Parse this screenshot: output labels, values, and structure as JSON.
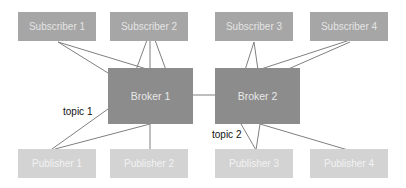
{
  "diagram": {
    "subscribers": [
      {
        "id": "sub1",
        "label": "Subscriber 1"
      },
      {
        "id": "sub2",
        "label": "Subscriber 2"
      },
      {
        "id": "sub3",
        "label": "Subscriber 3"
      },
      {
        "id": "sub4",
        "label": "Subscriber 4"
      }
    ],
    "brokers": [
      {
        "id": "broker1",
        "label": "Broker 1"
      },
      {
        "id": "broker2",
        "label": "Broker 2"
      }
    ],
    "publishers": [
      {
        "id": "pub1",
        "label": "Publisher 1"
      },
      {
        "id": "pub2",
        "label": "Publisher 2"
      },
      {
        "id": "pub3",
        "label": "Publisher 3"
      },
      {
        "id": "pub4",
        "label": "Publisher 4"
      }
    ],
    "topics": [
      {
        "id": "topic1",
        "label": "topic 1"
      },
      {
        "id": "topic2",
        "label": "topic 2"
      }
    ],
    "edges": [
      {
        "from": "sub1",
        "to": "broker1"
      },
      {
        "from": "sub1",
        "to": "broker1"
      },
      {
        "from": "sub2",
        "to": "broker1"
      },
      {
        "from": "sub2",
        "to": "broker1"
      },
      {
        "from": "sub2",
        "to": "broker1"
      },
      {
        "from": "sub3",
        "to": "broker2"
      },
      {
        "from": "sub3",
        "to": "broker2"
      },
      {
        "from": "sub4",
        "to": "broker2"
      },
      {
        "from": "sub4",
        "to": "broker2"
      },
      {
        "from": "broker1",
        "to": "broker2"
      },
      {
        "from": "pub1",
        "to": "broker1"
      },
      {
        "from": "pub1",
        "to": "broker1"
      },
      {
        "from": "pub2",
        "to": "broker1"
      },
      {
        "from": "pub3",
        "to": "broker2"
      },
      {
        "from": "pub3",
        "to": "broker2"
      },
      {
        "from": "pub4",
        "to": "broker2"
      }
    ]
  },
  "colors": {
    "subscriber_fill": "#a6a6a6",
    "broker_fill": "#8c8c8c",
    "publisher_fill": "#d3d3d3",
    "edge_color": "#7f7f7f"
  }
}
